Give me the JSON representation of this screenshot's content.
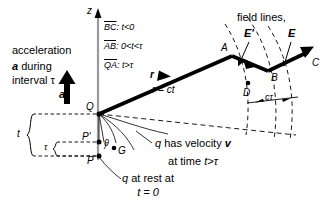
{
  "figure": {
    "title_text_absent": "",
    "axis": {
      "z_label": "z"
    },
    "legend": {
      "rows": [
        {
          "segment": "BC",
          "condition": ": t<0"
        },
        {
          "segment": "AB",
          "condition": ": 0<t<τ"
        },
        {
          "segment": "QA",
          "condition": ": t>τ"
        }
      ]
    },
    "annotations": {
      "acceleration_line1": "acceleration",
      "acceleration_bold_a": "a",
      "acceleration_line2_rest": " during",
      "acceleration_line3": "interval τ",
      "accel_arrow_label": "a",
      "field_lines": "field lines,",
      "E_prime": "E′",
      "E": "E",
      "r_vector": "r",
      "r_equals_ct": "r = ct",
      "c_tau": "cτ",
      "q_velocity_line1_q": "q",
      "q_velocity_line1_rest": " has velocity ",
      "q_velocity_line1_v": "v",
      "q_velocity_line2_pre": "at time ",
      "q_velocity_line2_cond": "t>τ",
      "q_rest_line1_q": "q",
      "q_rest_line1_rest": " at rest at",
      "q_rest_line2": "t = 0",
      "bracket_t": "t",
      "bracket_tau": "τ",
      "theta": "θ"
    },
    "points": {
      "Q": "Q",
      "A": "A",
      "B": "B",
      "C": "C",
      "D": "D",
      "G": "G",
      "P": "P",
      "P_prime": "P′"
    },
    "colors": {
      "ink": "#000000",
      "background": "#ffffff",
      "axis_gray": "#9a9a9a"
    }
  }
}
